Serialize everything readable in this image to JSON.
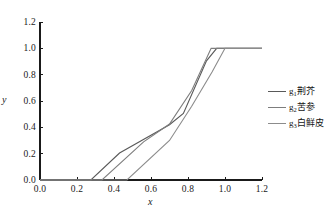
{
  "chart_data": {
    "type": "line",
    "title": "",
    "xlabel": "x",
    "ylabel": "y",
    "xlim": [
      0.0,
      1.2
    ],
    "ylim": [
      0.0,
      1.2
    ],
    "xticks": [
      "0.0",
      "0.2",
      "0.4",
      "0.6",
      "0.8",
      "1.0",
      "1.2"
    ],
    "yticks": [
      "0.0",
      "0.2",
      "0.4",
      "0.6",
      "0.8",
      "1.0",
      "1.2"
    ],
    "xtick_values": [
      0.0,
      0.2,
      0.4,
      0.6,
      0.8,
      1.0,
      1.2
    ],
    "ytick_values": [
      0.0,
      0.2,
      0.4,
      0.6,
      0.8,
      1.0,
      1.2
    ],
    "grid": false,
    "legend_position": "right",
    "series": [
      {
        "name": "g1",
        "label_base": "g",
        "label_sub": "1",
        "label_text": "荆芥",
        "color": "#595959",
        "x": [
          0.0,
          0.275,
          0.43,
          0.7,
          0.775,
          0.9,
          0.955,
          1.2
        ],
        "y": [
          0.0,
          0.0,
          0.205,
          0.42,
          0.505,
          0.905,
          1.0,
          1.0
        ]
      },
      {
        "name": "g2",
        "label_base": "g",
        "label_sub": "2",
        "label_text": "苦参",
        "color": "#7d7d7d",
        "x": [
          0.0,
          0.335,
          0.56,
          0.7,
          0.82,
          0.925,
          1.0,
          1.2
        ],
        "y": [
          0.0,
          0.0,
          0.29,
          0.425,
          0.68,
          1.0,
          1.0,
          1.0
        ]
      },
      {
        "name": "g3",
        "label_base": "g",
        "label_sub": "3",
        "label_text": "白鲜皮",
        "color": "#8c8c8c",
        "x": [
          0.0,
          0.47,
          0.7,
          0.82,
          0.93,
          1.0,
          1.2
        ],
        "y": [
          0.0,
          0.0,
          0.3,
          0.56,
          0.82,
          1.0,
          1.0
        ]
      }
    ]
  },
  "axis": {
    "x_title": "x",
    "y_title": "y"
  },
  "colors": {
    "axis": "#1a1a1a",
    "text": "#141414",
    "background": "#ffffff"
  }
}
